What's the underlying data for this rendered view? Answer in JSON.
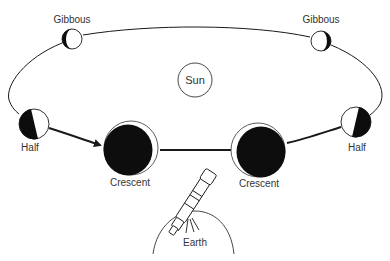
{
  "diagram": {
    "colors": {
      "line": "#1a1a1a",
      "dark_side": "#0d0d0d",
      "lit_side": "#ffffff",
      "text": "#333333"
    },
    "sun": {
      "label": "Sun"
    },
    "earth": {
      "label": "Earth"
    },
    "phases": [
      {
        "id": "gibbous-left",
        "label": "Gibbous"
      },
      {
        "id": "gibbous-right",
        "label": "Gibbous"
      },
      {
        "id": "half-left",
        "label": "Half"
      },
      {
        "id": "half-right",
        "label": "Half"
      },
      {
        "id": "crescent-left",
        "label": "Crescent"
      },
      {
        "id": "crescent-right",
        "label": "Crescent"
      }
    ],
    "orbit_direction": "arrow from left Half toward left Crescent"
  }
}
